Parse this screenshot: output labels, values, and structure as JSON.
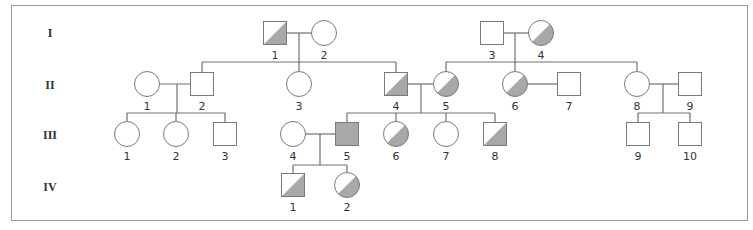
{
  "diagram": {
    "type": "pedigree",
    "colors": {
      "line": "#707070",
      "outline": "#7a7a7a",
      "fill": "#a8a8a8",
      "empty": "#ffffff"
    },
    "generations": [
      {
        "label": "I",
        "y": 33
      },
      {
        "label": "II",
        "y": 85
      },
      {
        "label": "III",
        "y": 135
      },
      {
        "label": "IV",
        "y": 187
      }
    ],
    "individuals": [
      {
        "id": "I-1",
        "label": "1",
        "sex": "male",
        "status": "carrier",
        "x": 275,
        "y": 33
      },
      {
        "id": "I-2",
        "label": "2",
        "sex": "female",
        "status": "unaffected",
        "x": 324,
        "y": 33
      },
      {
        "id": "I-3",
        "label": "3",
        "sex": "male",
        "status": "unaffected",
        "x": 492,
        "y": 33
      },
      {
        "id": "I-4",
        "label": "4",
        "sex": "female",
        "status": "carrier",
        "x": 541,
        "y": 33
      },
      {
        "id": "II-1",
        "label": "1",
        "sex": "female",
        "status": "unaffected",
        "x": 147,
        "y": 84
      },
      {
        "id": "II-2",
        "label": "2",
        "sex": "male",
        "status": "unaffected",
        "x": 202,
        "y": 84
      },
      {
        "id": "II-3",
        "label": "3",
        "sex": "female",
        "status": "unaffected",
        "x": 299,
        "y": 84
      },
      {
        "id": "II-4",
        "label": "4",
        "sex": "male",
        "status": "carrier",
        "x": 396,
        "y": 84
      },
      {
        "id": "II-5",
        "label": "5",
        "sex": "female",
        "status": "carrier",
        "x": 446,
        "y": 84
      },
      {
        "id": "II-6",
        "label": "6",
        "sex": "female",
        "status": "carrier",
        "x": 515,
        "y": 84
      },
      {
        "id": "II-7",
        "label": "7",
        "sex": "male",
        "status": "unaffected",
        "x": 569,
        "y": 84
      },
      {
        "id": "II-8",
        "label": "8",
        "sex": "female",
        "status": "unaffected",
        "x": 637,
        "y": 84
      },
      {
        "id": "II-9",
        "label": "9",
        "sex": "male",
        "status": "unaffected",
        "x": 690,
        "y": 84
      },
      {
        "id": "III-1",
        "label": "1",
        "sex": "female",
        "status": "unaffected",
        "x": 127,
        "y": 134
      },
      {
        "id": "III-2",
        "label": "2",
        "sex": "female",
        "status": "unaffected",
        "x": 176,
        "y": 134
      },
      {
        "id": "III-3",
        "label": "3",
        "sex": "male",
        "status": "unaffected",
        "x": 225,
        "y": 134
      },
      {
        "id": "III-4",
        "label": "4",
        "sex": "female",
        "status": "unaffected",
        "x": 293,
        "y": 134
      },
      {
        "id": "III-5",
        "label": "5",
        "sex": "male",
        "status": "affected",
        "x": 347,
        "y": 134
      },
      {
        "id": "III-6",
        "label": "6",
        "sex": "female",
        "status": "carrier",
        "x": 396,
        "y": 134
      },
      {
        "id": "III-7",
        "label": "7",
        "sex": "female",
        "status": "unaffected",
        "x": 446,
        "y": 134
      },
      {
        "id": "III-8",
        "label": "8",
        "sex": "male",
        "status": "carrier",
        "x": 495,
        "y": 134
      },
      {
        "id": "III-9",
        "label": "9",
        "sex": "male",
        "status": "unaffected",
        "x": 638,
        "y": 134
      },
      {
        "id": "III-10",
        "label": "10",
        "sex": "male",
        "status": "unaffected",
        "x": 690,
        "y": 134
      },
      {
        "id": "IV-1",
        "label": "1",
        "sex": "male",
        "status": "carrier",
        "x": 293,
        "y": 185
      },
      {
        "id": "IV-2",
        "label": "2",
        "sex": "female",
        "status": "carrier",
        "x": 347,
        "y": 185
      }
    ],
    "couples": [
      {
        "a": "I-1",
        "b": "I-2",
        "dropX": 299,
        "y": 33,
        "sibY": 62,
        "children": [
          "II-2",
          "II-3",
          "II-4"
        ]
      },
      {
        "a": "I-3",
        "b": "I-4",
        "dropX": 515,
        "y": 33,
        "sibY": 62,
        "children": [
          "II-5",
          "II-6",
          "II-8"
        ]
      },
      {
        "a": "II-1",
        "b": "II-2",
        "dropX": 177,
        "y": 84,
        "sibY": 113,
        "children": [
          "III-1",
          "III-2",
          "III-3"
        ]
      },
      {
        "a": "II-4",
        "b": "II-5",
        "dropX": 421,
        "y": 84,
        "sibY": 113,
        "children": [
          "III-5",
          "III-6",
          "III-7",
          "III-8"
        ]
      },
      {
        "a": "II-6",
        "b": "II-7",
        "dropX": null,
        "y": 84,
        "sibY": null,
        "children": []
      },
      {
        "a": "II-8",
        "b": "II-9",
        "dropX": 663,
        "y": 84,
        "sibY": 113,
        "children": [
          "III-9",
          "III-10"
        ]
      },
      {
        "a": "III-4",
        "b": "III-5",
        "dropX": 320,
        "y": 134,
        "sibY": 165,
        "children": [
          "IV-1",
          "IV-2"
        ]
      }
    ],
    "legend_symbols": {
      "male": "square",
      "female": "circle",
      "affected": "fully shaded",
      "carrier": "half shaded (lower-right diagonal)",
      "unaffected": "unshaded"
    }
  }
}
